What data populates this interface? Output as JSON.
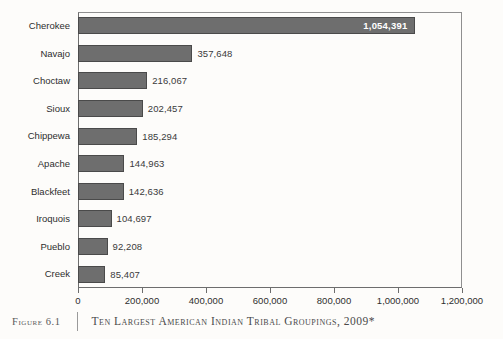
{
  "caption": {
    "figure_number": "Figure 6.1",
    "title": "Ten Largest American Indian Tribal Groupings, 2009*"
  },
  "chart_data": {
    "type": "bar",
    "orientation": "horizontal",
    "title": "Ten Largest American Indian Tribal Groupings, 2009*",
    "xlabel": "",
    "ylabel": "",
    "xlim": [
      0,
      1200000
    ],
    "grid": false,
    "legend": "none",
    "categories": [
      "Cherokee",
      "Navajo",
      "Choctaw",
      "Sioux",
      "Chippewa",
      "Apache",
      "Blackfeet",
      "Iroquois",
      "Pueblo",
      "Creek"
    ],
    "values": [
      1054391,
      357648,
      216067,
      202457,
      185294,
      144963,
      142636,
      104697,
      92208,
      85407
    ],
    "value_labels": [
      "1,054,391",
      "357,648",
      "216,067",
      "202,457",
      "185,294",
      "144,963",
      "142,636",
      "104,697",
      "92,208",
      "85,407"
    ],
    "label_placement": [
      "inside",
      "outside",
      "outside",
      "outside",
      "outside",
      "outside",
      "outside",
      "outside",
      "outside",
      "outside"
    ],
    "xticks": [
      0,
      200000,
      400000,
      600000,
      800000,
      1000000,
      1200000
    ],
    "xtick_labels": [
      "0",
      "200,000",
      "400,000",
      "600,000",
      "800,000",
      "1,000,000",
      "1,200,000"
    ],
    "bar_color": "#6e6e6e",
    "bar_edge_color": "#4a4a4a",
    "inside_label_color": "#ffffff",
    "outside_label_color": "#3a3a3a"
  }
}
